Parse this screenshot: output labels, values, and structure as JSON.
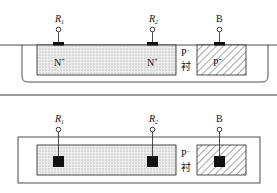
{
  "diagram": {
    "type": "semiconductor-cross-section-and-top-view",
    "cross_section": {
      "terminals": [
        {
          "label": "R",
          "sub": "1",
          "italic": true
        },
        {
          "label": "R",
          "sub": "2",
          "italic": true
        },
        {
          "label": "B",
          "sub": "",
          "italic": false
        }
      ],
      "regions": {
        "n_plus_left": "N",
        "n_plus_right": "N",
        "n_sup": "+",
        "p_plus": "P",
        "p_plus_sup": "+",
        "substrate_main": "P",
        "substrate_sup": "−",
        "substrate_suffix": "衬"
      }
    },
    "top_view": {
      "terminals": [
        {
          "label": "R",
          "sub": "1",
          "italic": true
        },
        {
          "label": "R",
          "sub": "2",
          "italic": true
        },
        {
          "label": "B",
          "sub": "",
          "italic": false
        }
      ],
      "substrate_main": "P",
      "substrate_sup": "−",
      "substrate_suffix": "衬"
    },
    "colors": {
      "line": "#222222",
      "n_plus_fill": "#e6e6e6",
      "dot": "#9a9a9a",
      "contact": "#111111"
    }
  }
}
